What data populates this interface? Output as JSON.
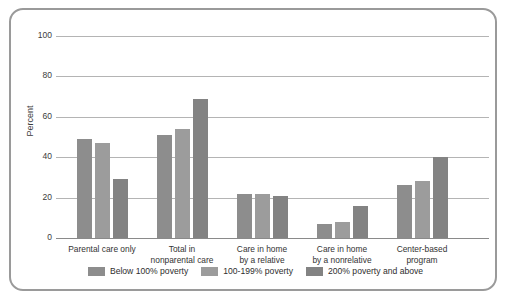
{
  "chart_data": {
    "type": "bar",
    "title": "",
    "xlabel": "",
    "ylabel": "Percent",
    "ylim": [
      0,
      100
    ],
    "yticks": [
      0,
      20,
      40,
      60,
      80,
      100
    ],
    "grid": true,
    "legend_position": "bottom",
    "categories": [
      "Parental care only",
      "Total in\nnonparental care",
      "Care in home\nby a relative",
      "Care in home\nby a nonrelative",
      "Center-based\nprogram"
    ],
    "series": [
      {
        "name": "Below 100% poverty",
        "color": "#8d8d8d",
        "values": [
          49,
          51,
          22,
          7,
          26
        ]
      },
      {
        "name": "100-199% poverty",
        "color": "#9c9c9c",
        "values": [
          47,
          54,
          22,
          8,
          28
        ]
      },
      {
        "name": "200% poverty and above",
        "color": "#838383",
        "values": [
          29,
          69,
          21,
          16,
          40
        ]
      }
    ]
  },
  "axis": {
    "y_label": "Percent",
    "y_ticks": [
      "100",
      "80",
      "60",
      "40",
      "20",
      "0"
    ]
  },
  "legend": {
    "items": [
      {
        "label": "Below 100% poverty",
        "color": "#8d8d8d"
      },
      {
        "label": "100-199% poverty",
        "color": "#9c9c9c"
      },
      {
        "label": "200% poverty and above",
        "color": "#838383"
      }
    ]
  },
  "groups": [
    {
      "line1": "Parental care only",
      "line2": ""
    },
    {
      "line1": "Total in",
      "line2": "nonparental care"
    },
    {
      "line1": "Care in home",
      "line2": "by a relative"
    },
    {
      "line1": "Care in home",
      "line2": "by a nonrelative"
    },
    {
      "line1": "Center-based",
      "line2": "program"
    }
  ]
}
